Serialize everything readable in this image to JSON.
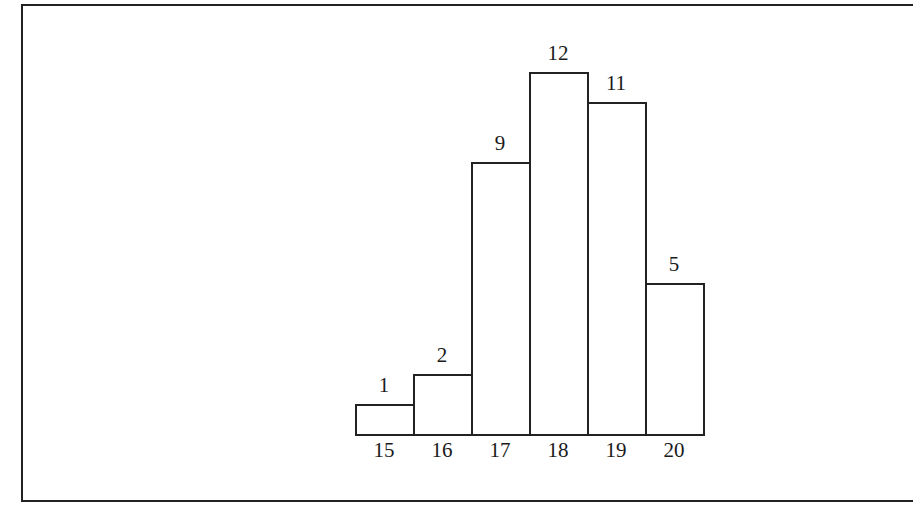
{
  "chart_data": {
    "type": "bar",
    "title": "",
    "xlabel": "",
    "ylabel": "",
    "categories": [
      "15",
      "16",
      "17",
      "18",
      "19",
      "20"
    ],
    "values": [
      1,
      2,
      9,
      12,
      11,
      5
    ],
    "value_labels": [
      "1",
      "2",
      "9",
      "12",
      "11",
      "5"
    ],
    "ylim": [
      0,
      12
    ],
    "grid": false,
    "legend": null,
    "bar_style": "histogram, adjacent bars, black outline, white fill",
    "colors": {
      "stroke": "#222222",
      "fill": "#ffffff",
      "text": "#1a1a1a"
    }
  }
}
